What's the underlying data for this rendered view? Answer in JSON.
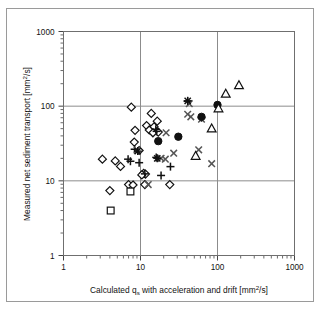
{
  "chart_data": {
    "type": "scatter",
    "title": "",
    "xlabel": "Calculated q_s with acceleration and drift  [mm2/s]",
    "xlabel_main": "Calculated q",
    "xlabel_sub": "s",
    "xlabel_rest": " with acceleration and drift  [mm",
    "xlabel_sup": "2",
    "xlabel_tail": "/s]",
    "ylabel": "Measured net sediment transport  [mm2/s]",
    "ylabel_main": "Measured net sediment transport  [mm",
    "ylabel_sup": "2",
    "ylabel_tail": "/s]",
    "xscale": "log",
    "yscale": "log",
    "xlim": [
      1,
      1000
    ],
    "ylim": [
      1,
      1000
    ],
    "xticks": [
      "1",
      "10",
      "100",
      "1000"
    ],
    "yticks": [
      "1",
      "10",
      "100",
      "1000"
    ],
    "xtick_values": [
      1,
      10,
      100,
      1000
    ],
    "ytick_values": [
      1,
      10,
      100,
      1000
    ],
    "grid": "major-decades",
    "legend": "none",
    "series": [
      {
        "name": "diamond",
        "marker": "open-diamond",
        "color": "#111111",
        "points": [
          [
            3.2,
            19.5
          ],
          [
            4.0,
            7.4
          ],
          [
            4.7,
            18.5
          ],
          [
            5.5,
            15.6
          ],
          [
            7.0,
            8.9
          ],
          [
            7.6,
            97.0
          ],
          [
            8.5,
            47.5
          ],
          [
            8.3,
            33.0
          ],
          [
            9.6,
            25.5
          ],
          [
            11.0,
            12.6
          ],
          [
            11.6,
            12.3
          ],
          [
            12.0,
            55.0
          ],
          [
            13.0,
            48.0
          ],
          [
            13.8,
            80.0
          ],
          [
            15.0,
            53.0
          ],
          [
            16.5,
            63.0
          ],
          [
            11.4,
            8.9
          ],
          [
            17.0,
            45.0
          ],
          [
            24.0,
            8.9
          ],
          [
            10.4,
            12.0
          ],
          [
            8.0,
            8.8
          ],
          [
            14.5,
            44.0
          ]
        ]
      },
      {
        "name": "plus",
        "marker": "plus",
        "color": "#111111",
        "points": [
          [
            6.9,
            19.5
          ],
          [
            7.4,
            18.3
          ],
          [
            8.4,
            26.5
          ],
          [
            11.4,
            12.4
          ],
          [
            15.8,
            49.0
          ],
          [
            16.0,
            20.6
          ],
          [
            18.5,
            11.8
          ],
          [
            24.5,
            15.5
          ],
          [
            41.0,
            116.0
          ],
          [
            62.0,
            70.0
          ],
          [
            16.2,
            46.0
          ],
          [
            9.6,
            17.5
          ]
        ]
      },
      {
        "name": "cross",
        "marker": "x",
        "color": "#555555",
        "points": [
          [
            9.0,
            25.8
          ],
          [
            12.6,
            8.9
          ],
          [
            21.5,
            44.0
          ],
          [
            27.0,
            23.5
          ],
          [
            41.0,
            78.0
          ],
          [
            43.0,
            108.0
          ],
          [
            45.0,
            72.0
          ],
          [
            57.0,
            26.0
          ],
          [
            18.5,
            20.0
          ],
          [
            21.0,
            19.5
          ],
          [
            62.0,
            67.0
          ],
          [
            84.0,
            17.0
          ]
        ]
      },
      {
        "name": "filled-circle",
        "marker": "filled-circle",
        "color": "#111111",
        "points": [
          [
            17.0,
            34.0
          ],
          [
            31.0,
            39.0
          ],
          [
            62.0,
            72.0
          ],
          [
            100.0,
            104.0
          ]
        ]
      },
      {
        "name": "triangle",
        "marker": "open-triangle",
        "color": "#111111",
        "points": [
          [
            52.0,
            21.5
          ],
          [
            84.0,
            50.0
          ],
          [
            103.0,
            93.0
          ],
          [
            128.0,
            146.0
          ],
          [
            190.0,
            190.0
          ]
        ]
      },
      {
        "name": "square",
        "marker": "open-square",
        "color": "#111111",
        "points": [
          [
            4.1,
            4.0
          ],
          [
            7.4,
            7.2
          ]
        ]
      },
      {
        "name": "star",
        "marker": "star",
        "color": "#111111",
        "points": [
          [
            16.5,
            20.0
          ],
          [
            41.0,
            118.0
          ],
          [
            9.2,
            25.0
          ]
        ]
      }
    ]
  },
  "figure": {
    "background": "#ffffff",
    "frame_color": "#9a9a9a",
    "grid_color": "#8c8c8c",
    "axis_color": "#444444"
  }
}
